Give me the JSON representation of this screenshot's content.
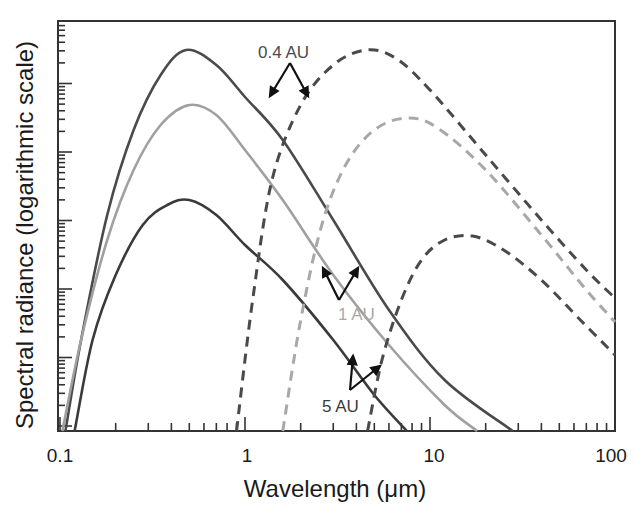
{
  "chart_data": {
    "type": "line",
    "title": "",
    "xlabel": "Wavelength (μm)",
    "ylabel": "Spectral radiance (logarithmic scale)",
    "xscale": "log",
    "yscale": "log",
    "xlim": [
      0.1,
      100
    ],
    "x_ticks": [
      "0.1",
      "1",
      "10",
      "100"
    ],
    "y_ticks": [],
    "grid": false,
    "legend": null,
    "series": [
      {
        "name": "Solar (reflected) 0.4 AU",
        "style": "solid",
        "color": "#4a4a4a",
        "x": [
          0.107,
          0.13,
          0.18,
          0.25,
          0.35,
          0.48,
          0.7,
          1.0,
          1.6,
          3.0,
          6.0,
          12.0,
          28.0
        ],
        "y_px": [
          431,
          340,
          215,
          130,
          75,
          50,
          65,
          97,
          140,
          220,
          310,
          380,
          431
        ]
      },
      {
        "name": "Solar (reflected) 1 AU",
        "style": "solid",
        "color": "#a0a0a0",
        "x": [
          0.103,
          0.13,
          0.18,
          0.25,
          0.35,
          0.5,
          0.7,
          1.0,
          1.6,
          3.0,
          6.0,
          12.0,
          18.0
        ],
        "y_px": [
          431,
          340,
          240,
          170,
          125,
          105,
          115,
          150,
          200,
          275,
          345,
          405,
          431
        ]
      },
      {
        "name": "Solar (reflected) 5 AU",
        "style": "solid",
        "color": "#3a3a3a",
        "x": [
          0.12,
          0.15,
          0.2,
          0.28,
          0.38,
          0.5,
          0.7,
          1.0,
          1.6,
          3.0,
          5.0,
          7.5
        ],
        "y_px": [
          431,
          340,
          275,
          225,
          205,
          200,
          215,
          245,
          280,
          340,
          395,
          431
        ]
      },
      {
        "name": "Thermal emission 0.4 AU",
        "style": "dashed",
        "color": "#4a4a4a",
        "x": [
          0.9,
          1.1,
          1.4,
          2.0,
          3.0,
          4.5,
          6.5,
          10.0,
          20.0,
          40.0,
          70.0,
          100.0
        ],
        "y_px": [
          431,
          300,
          180,
          105,
          65,
          50,
          58,
          90,
          155,
          220,
          270,
          298
        ]
      },
      {
        "name": "Thermal emission 1 AU",
        "style": "dashed",
        "color": "#a8a8a8",
        "x": [
          1.6,
          2.0,
          2.6,
          3.5,
          5.0,
          7.5,
          11.0,
          20.0,
          40.0,
          70.0,
          100.0
        ],
        "y_px": [
          431,
          320,
          225,
          165,
          130,
          118,
          128,
          170,
          235,
          290,
          322
        ]
      },
      {
        "name": "Thermal emission 5 AU",
        "style": "dashed",
        "color": "#4a4a4a",
        "x": [
          4.6,
          5.5,
          7.0,
          9.0,
          12.0,
          17.0,
          25.0,
          40.0,
          65.0,
          100.0
        ],
        "y_px": [
          431,
          360,
          300,
          260,
          240,
          236,
          250,
          280,
          320,
          355
        ]
      }
    ],
    "annotations": [
      {
        "text": "0.4 AU",
        "color": "#4a4a4a",
        "x_px": 258,
        "y_px": 58
      },
      {
        "text": "1 AU",
        "color": "#a8a8a8",
        "x_px": 338,
        "y_px": 320
      },
      {
        "text": "5 AU",
        "color": "#3a3a3a",
        "x_px": 322,
        "y_px": 412
      }
    ]
  },
  "labels": {
    "xlabel": "Wavelength (μm)",
    "ylabel": "Spectral radiance (logarithmic scale)",
    "xticks": [
      "0.1",
      "1",
      "10",
      "100"
    ],
    "annot_04": "0.4 AU",
    "annot_1": "1 AU",
    "annot_5": "5 AU"
  }
}
